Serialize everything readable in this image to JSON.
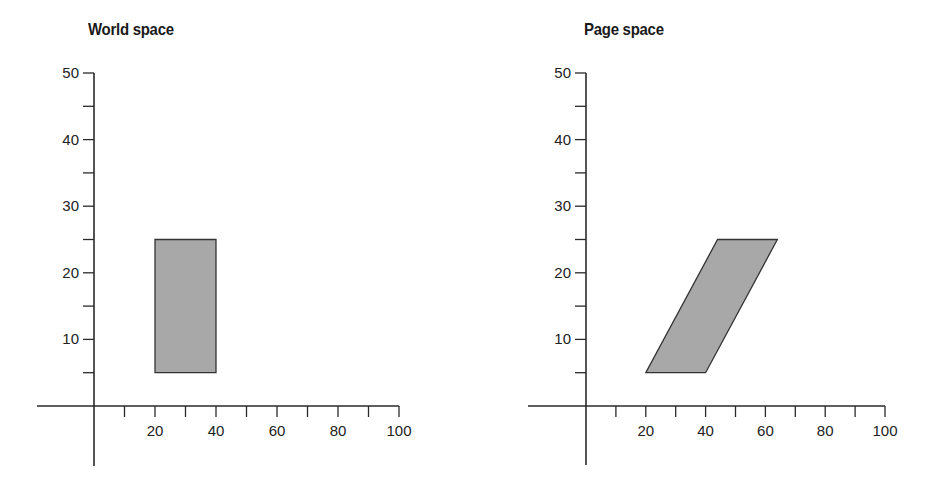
{
  "chart_data": [
    {
      "type": "scatter",
      "title": "World space",
      "xlabel": "",
      "ylabel": "",
      "xlim": [
        -19,
        100
      ],
      "ylim": [
        -9,
        50
      ],
      "x_ticks": [
        20,
        40,
        60,
        80,
        100
      ],
      "x_minor_ticks": [
        10,
        30,
        50,
        70,
        90
      ],
      "y_ticks": [
        10,
        20,
        30,
        40,
        50
      ],
      "y_minor_ticks": [
        5,
        15,
        25,
        35,
        45
      ],
      "grid": false,
      "shape": {
        "kind": "rectangle",
        "points": [
          [
            20,
            5
          ],
          [
            40,
            5
          ],
          [
            40,
            25
          ],
          [
            20,
            25
          ]
        ],
        "fill": "#a8a8a8",
        "stroke": "#333333"
      }
    },
    {
      "type": "scatter",
      "title": "Page space",
      "xlabel": "",
      "ylabel": "",
      "xlim": [
        -19,
        100
      ],
      "ylim": [
        -9,
        50
      ],
      "x_ticks": [
        20,
        40,
        60,
        80,
        100
      ],
      "x_minor_ticks": [
        10,
        30,
        50,
        70,
        90
      ],
      "y_ticks": [
        10,
        20,
        30,
        40,
        50
      ],
      "y_minor_ticks": [
        5,
        15,
        25,
        35,
        45
      ],
      "grid": false,
      "shape": {
        "kind": "parallelogram",
        "points": [
          [
            20,
            5
          ],
          [
            40,
            5
          ],
          [
            64,
            25
          ],
          [
            44,
            25
          ]
        ],
        "fill": "#a8a8a8",
        "stroke": "#333333"
      }
    }
  ],
  "panels": {
    "left": {
      "title": "World space"
    },
    "right": {
      "title": "Page space"
    }
  },
  "axis_labels": {
    "x": [
      "20",
      "40",
      "60",
      "80",
      "100"
    ],
    "y": [
      "10",
      "20",
      "30",
      "40",
      "50"
    ]
  }
}
